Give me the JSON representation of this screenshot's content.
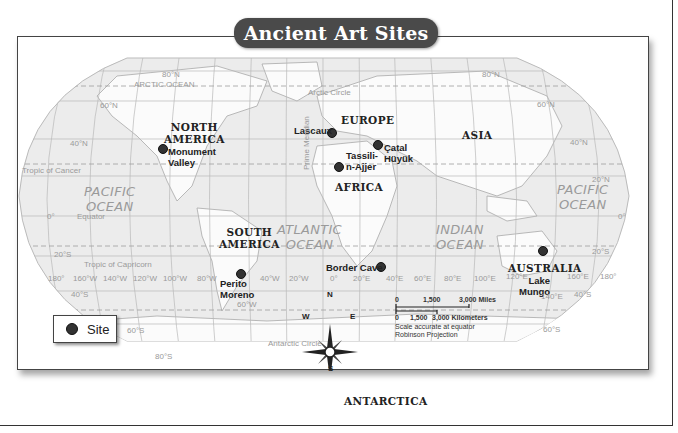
{
  "title": "Ancient Art Sites",
  "legend": {
    "label": "Site",
    "symbol": "dot"
  },
  "continents": [
    {
      "id": "north-america",
      "label": "NORTH\nAMERICA",
      "lines": [
        "NORTH",
        "AMERICA"
      ]
    },
    {
      "id": "south-america",
      "label": "SOUTH AMERICA",
      "lines": [
        "SOUTH",
        "AMERICA"
      ]
    },
    {
      "id": "europe",
      "label": "EUROPE",
      "lines": [
        "EUROPE"
      ]
    },
    {
      "id": "africa",
      "label": "AFRICA",
      "lines": [
        "AFRICA"
      ]
    },
    {
      "id": "asia",
      "label": "ASIA",
      "lines": [
        "ASIA"
      ]
    },
    {
      "id": "australia",
      "label": "AUSTRALIA",
      "lines": [
        "AUSTRALIA"
      ]
    },
    {
      "id": "antarctica",
      "label": "ANTARCTICA",
      "lines": [
        "ANTARCTICA"
      ]
    }
  ],
  "oceans": [
    {
      "id": "pacific-west",
      "lines": [
        "PACIFIC",
        "OCEAN"
      ]
    },
    {
      "id": "atlantic",
      "lines": [
        "ATLANTIC",
        "OCEAN"
      ]
    },
    {
      "id": "indian",
      "lines": [
        "INDIAN",
        "OCEAN"
      ]
    },
    {
      "id": "pacific-east",
      "lines": [
        "PACIFIC",
        "OCEAN"
      ]
    },
    {
      "id": "arctic",
      "lines": [
        "ARCTIC OCEAN"
      ]
    }
  ],
  "sites": [
    {
      "name": "Monument Valley",
      "lines": [
        "Monument",
        "Valley"
      ]
    },
    {
      "name": "Lascaux",
      "lines": [
        "Lascaux"
      ]
    },
    {
      "name": "Tassili-n-Ajjer",
      "lines": [
        "Tassili-",
        "n-Ajjer"
      ]
    },
    {
      "name": "Catal Hüyük",
      "lines": [
        "Çatal",
        "Hüyük"
      ]
    },
    {
      "name": "Perito Moreno",
      "lines": [
        "Perito",
        "Moreno"
      ]
    },
    {
      "name": "Border Cave",
      "lines": [
        "Border Cave"
      ]
    },
    {
      "name": "Lake Mungo",
      "lines": [
        "Lake",
        "Mungo"
      ]
    }
  ],
  "reference_lines": {
    "arctic_circle": "Arctic Circle",
    "tropic_cancer": "Tropic of Cancer",
    "equator": "Equator",
    "tropic_capricorn": "Tropic of Capricorn",
    "antarctic_circle": "Antarctic Circle",
    "prime_meridian": "Prime Meridian"
  },
  "latitudes": [
    "80°N",
    "60°N",
    "40°N",
    "20°N",
    "0°",
    "20°S",
    "40°S",
    "60°S",
    "80°S"
  ],
  "longitudes": [
    "180°",
    "160°W",
    "140°W",
    "120°W",
    "100°W",
    "80°W",
    "40°W",
    "20°W",
    "0°",
    "20°E",
    "40°E",
    "60°E",
    "80°E",
    "100°E",
    "120°E",
    "160°E",
    "180°",
    "60°W",
    "140°E"
  ],
  "compass": {
    "n": "N",
    "s": "S",
    "e": "E",
    "w": "W"
  },
  "scale": {
    "miles_ticks": [
      "0",
      "1,500",
      "3,000 Miles"
    ],
    "km_ticks": [
      "0",
      "1,500",
      "3,000 Kilometers"
    ],
    "note1": "Scale accurate at equator",
    "note2": "Robinson Projection"
  }
}
